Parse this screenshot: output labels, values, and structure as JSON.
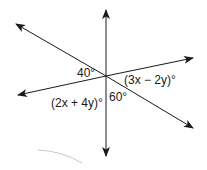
{
  "diagram": {
    "type": "three intersecting lines",
    "intersection": {
      "x": 106,
      "y": 76
    },
    "lines": [
      {
        "id": "vertical",
        "from": [
          106,
          10
        ],
        "to": [
          106,
          156
        ]
      },
      {
        "id": "descending",
        "from": [
          16,
          24
        ],
        "to": [
          193,
          128
        ]
      },
      {
        "id": "ascending",
        "from": [
          18,
          95
        ],
        "to": [
          193,
          58
        ]
      }
    ],
    "angles": [
      {
        "label": "40°",
        "x": 77,
        "y": 77
      },
      {
        "label": "(3x − 2y)°",
        "x": 124,
        "y": 84
      },
      {
        "label": "(2x + 4y)°",
        "x": 51,
        "y": 107
      },
      {
        "label": "60°",
        "x": 109,
        "y": 101
      }
    ],
    "colors": {
      "line": "#1a1a1a",
      "smudge": "#c8c8c8"
    }
  }
}
